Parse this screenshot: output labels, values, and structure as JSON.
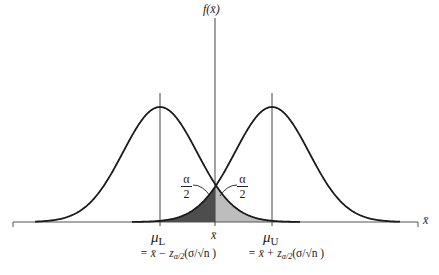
{
  "diagram": {
    "type": "two normal sampling distributions with confidence interval bounds",
    "y_axis_label": "f(x̄)",
    "x_axis_label": "x̄",
    "curves": [
      {
        "name": "lower-distribution",
        "center_label": "μL",
        "mean_px": 160
      },
      {
        "name": "upper-distribution",
        "center_label": "μU",
        "mean_px": 272
      }
    ],
    "shaded_regions": [
      {
        "name": "left-tail-of-upper",
        "label": "α/2",
        "shade": "#555555"
      },
      {
        "name": "right-tail-of-lower",
        "label": "α/2",
        "shade": "#bbbbbb"
      }
    ],
    "labels": {
      "mu_lower_symbol": "μ",
      "mu_lower_sub": "L",
      "mu_upper_symbol": "μ",
      "mu_upper_sub": "U",
      "xbar": "x̄",
      "alpha_num": "α",
      "alpha_den": "2",
      "formula_lower": "= x̄ − z",
      "formula_lower_sub": "α/2",
      "formula_lower_tail": "(σ/√n )",
      "formula_upper": "= x̄ + z",
      "formula_upper_sub": "α/2",
      "formula_upper_tail": "(σ/√n )",
      "fx_label": "f(x̄)",
      "x_axis_label": "x̄"
    },
    "colors": {
      "curve": "#1a1a1a",
      "axis": "#555555",
      "dark_shade": "#4d4d4d",
      "light_shade": "#bdbdbd"
    }
  }
}
